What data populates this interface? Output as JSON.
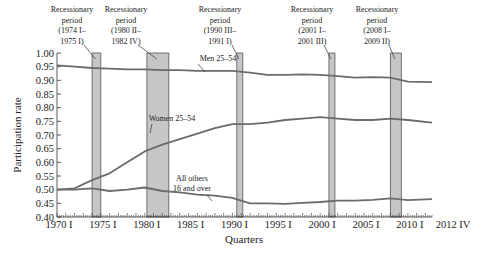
{
  "chart_data": {
    "type": "line",
    "title": "",
    "xlabel": "Quarters",
    "ylabel": "Participation rate",
    "ylim": [
      0.4,
      1.0
    ],
    "yticks": [
      "1.00",
      "0.95",
      "0.90",
      "0.85",
      "0.80",
      "0.75",
      "0.70",
      "0.65",
      "0.60",
      "0.55",
      "0.50",
      "0.45",
      "0.40"
    ],
    "xticks": [
      "1970 I",
      "1975 I",
      "1980 I",
      "1985 I",
      "1990 I",
      "1995 I",
      "2000 I",
      "2005 I",
      "2010 I",
      "2012 IV"
    ],
    "xrange": [
      "1970 I",
      "2012 IV"
    ],
    "grid": false,
    "x": [
      1970.0,
      1972.0,
      1974.0,
      1976.0,
      1978.0,
      1980.0,
      1982.0,
      1984.0,
      1986.0,
      1988.0,
      1990.0,
      1992.0,
      1994.0,
      1996.0,
      1998.0,
      2000.0,
      2002.0,
      2004.0,
      2006.0,
      2008.0,
      2010.0,
      2012.75
    ],
    "series": [
      {
        "name": "Men 25–54",
        "values": [
          0.955,
          0.95,
          0.945,
          0.943,
          0.94,
          0.94,
          0.937,
          0.937,
          0.935,
          0.935,
          0.935,
          0.928,
          0.92,
          0.92,
          0.922,
          0.92,
          0.915,
          0.91,
          0.912,
          0.91,
          0.895,
          0.893
        ]
      },
      {
        "name": "Women 25–54",
        "values": [
          0.5,
          0.505,
          0.535,
          0.56,
          0.6,
          0.64,
          0.665,
          0.685,
          0.705,
          0.725,
          0.74,
          0.74,
          0.745,
          0.755,
          0.76,
          0.765,
          0.76,
          0.755,
          0.755,
          0.76,
          0.755,
          0.745
        ]
      },
      {
        "name": "All others 16 and over",
        "values": [
          0.5,
          0.5,
          0.505,
          0.495,
          0.5,
          0.508,
          0.495,
          0.49,
          0.482,
          0.478,
          0.47,
          0.45,
          0.45,
          0.448,
          0.452,
          0.455,
          0.46,
          0.46,
          0.463,
          0.468,
          0.462,
          0.465
        ]
      }
    ],
    "recessions": [
      {
        "label_lines": [
          "Recessionary",
          "period",
          "(1974 I–",
          "1975 I)"
        ],
        "start": 1974.0,
        "end": 1975.0
      },
      {
        "label_lines": [
          "Recessionary",
          "period",
          "(1980 II–",
          "1982 IV)"
        ],
        "start": 1980.25,
        "end": 1982.75
      },
      {
        "label_lines": [
          "Recessionary",
          "period",
          "(1990 III–",
          "1991 I)"
        ],
        "start": 1990.5,
        "end": 1991.0
      },
      {
        "label_lines": [
          "Recessionary",
          "period",
          "(2001 I–",
          "2001 III)"
        ],
        "start": 2001.0,
        "end": 2001.5
      },
      {
        "label_lines": [
          "Recessionary",
          "period",
          "(2008 I–",
          "2009 II)"
        ],
        "start": 2008.0,
        "end": 2009.25
      }
    ],
    "annotations": [
      {
        "text_lines": [
          "Men 25–54"
        ],
        "series": "Men 25–54"
      },
      {
        "text_lines": [
          "Women 25–54"
        ],
        "series": "Women 25–54"
      },
      {
        "text_lines": [
          "All others",
          "16 and over"
        ],
        "series": "All others 16 and over"
      }
    ]
  },
  "colors": {
    "line": "#6b6b6b",
    "recession_fill": "#c6c6c6",
    "recession_stroke": "#555555",
    "axis": "#333333",
    "text": "#222222"
  }
}
